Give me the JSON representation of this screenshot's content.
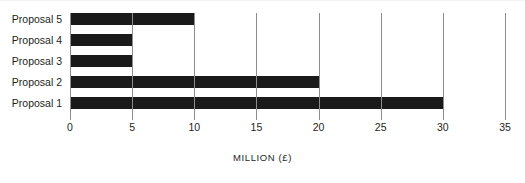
{
  "chart_data": {
    "type": "bar",
    "orientation": "horizontal",
    "title": "",
    "subtitle": "",
    "xlabel": "MILLION (£)",
    "ylabel": "",
    "categories": [
      "Proposal 1",
      "Proposal 2",
      "Proposal 3",
      "Proposal 4",
      "Proposal 5"
    ],
    "values": [
      30,
      20,
      5,
      5,
      10
    ],
    "series": [
      {
        "name": "Cost",
        "values": [
          30,
          20,
          5,
          5,
          10
        ]
      }
    ],
    "display_order_top_to_bottom": [
      "Proposal 5",
      "Proposal 4",
      "Proposal 3",
      "Proposal 2",
      "Proposal 1"
    ],
    "xlim": [
      0,
      35
    ],
    "xticks": [
      0,
      5,
      10,
      15,
      20,
      25,
      30,
      35
    ],
    "xtick_labels": [
      "0",
      "5",
      "10",
      "15",
      "20",
      "25",
      "30",
      "35"
    ],
    "grid": true,
    "grid_axis": "x",
    "legend": false,
    "legend_position": "none",
    "bar_color": "#1a1a1a",
    "grid_color": "#8c8c8c",
    "text_color": "#231f20",
    "background_color": "#ffffff"
  },
  "bars": [
    {
      "label": "Proposal 5",
      "value": 10
    },
    {
      "label": "Proposal 4",
      "value": 5
    },
    {
      "label": "Proposal 3",
      "value": 5
    },
    {
      "label": "Proposal 2",
      "value": 20
    },
    {
      "label": "Proposal 1",
      "value": 30
    }
  ],
  "axis": {
    "title": "MILLION (£)",
    "ticks": [
      "0",
      "5",
      "10",
      "15",
      "20",
      "25",
      "30",
      "35"
    ]
  }
}
